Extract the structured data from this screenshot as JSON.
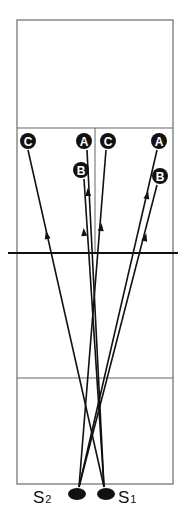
{
  "diagram": {
    "type": "volleyball-serve-paths",
    "court": {
      "left": 17,
      "right": 173,
      "top": 20,
      "bottom": 484,
      "center_x": 95,
      "upper_attack_y": 128,
      "net_y": 253,
      "lower_attack_y": 378,
      "net_left": 8,
      "net_right": 178
    },
    "targets": [
      {
        "id": "C-left",
        "label": "C",
        "x": 28,
        "y": 141
      },
      {
        "id": "A-center",
        "label": "A",
        "x": 84,
        "y": 141
      },
      {
        "id": "B-center",
        "label": "B",
        "x": 81,
        "y": 170
      },
      {
        "id": "C-center",
        "label": "C",
        "x": 108,
        "y": 141
      },
      {
        "id": "A-right",
        "label": "A",
        "x": 159,
        "y": 141
      },
      {
        "id": "B-right",
        "label": "B",
        "x": 160,
        "y": 176
      }
    ],
    "servers": [
      {
        "id": "S2",
        "label": "S",
        "sub": "2",
        "x": 77,
        "y": 494,
        "label_x": 33,
        "label_y": 503
      },
      {
        "id": "S1",
        "label": "S",
        "sub": "1",
        "x": 106,
        "y": 494,
        "label_x": 118,
        "label_y": 503
      }
    ],
    "paths": [
      {
        "from": [
          104,
          487
        ],
        "to": [
          28,
          150
        ],
        "arrow": [
          47,
          236
        ]
      },
      {
        "from": [
          104,
          487
        ],
        "to": [
          87,
          150
        ],
        "arrow": [
          88,
          193
        ]
      },
      {
        "from": [
          104,
          487
        ],
        "to": [
          84,
          179
        ],
        "arrow": [
          84,
          233
        ]
      },
      {
        "from": [
          79,
          487
        ],
        "to": [
          106,
          150
        ],
        "arrow": [
          101,
          228
        ]
      },
      {
        "from": [
          79,
          487
        ],
        "to": [
          157,
          150
        ],
        "arrow": [
          147,
          196
        ]
      },
      {
        "from": [
          79,
          487
        ],
        "to": [
          157,
          185
        ],
        "arrow": [
          145,
          238
        ]
      }
    ]
  }
}
